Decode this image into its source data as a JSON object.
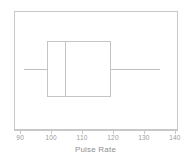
{
  "chart_data": {
    "type": "box",
    "title": "",
    "xlabel": "Pulse Rate",
    "ylabel": "",
    "xlim": [
      88,
      141
    ],
    "grid": false,
    "legend": null,
    "orientation": "horizontal",
    "axis": {
      "ticks": [
        {
          "value": 90,
          "label": "90"
        },
        {
          "value": 100,
          "label": "100"
        },
        {
          "value": 110,
          "label": "110"
        },
        {
          "value": 120,
          "label": "120"
        },
        {
          "value": 130,
          "label": "130"
        },
        {
          "value": 140,
          "label": "140"
        }
      ]
    },
    "boxes": [
      {
        "name": "Pulse Rate",
        "whisker_low": 91.3,
        "q1": 98.8,
        "median": 104.4,
        "q3": 119.4,
        "whisker_high": 135.3,
        "outliers": []
      }
    ],
    "colors": {
      "box_line": "#c4c4c4",
      "whisker_line": "#c0c0c0",
      "frame": "#c8c8c8",
      "text": "#8f8f8f",
      "background": "#ffffff"
    }
  }
}
